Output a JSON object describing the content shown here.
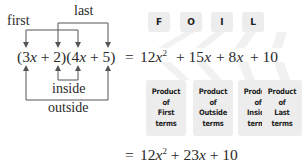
{
  "labels": {
    "first": "first",
    "last": "last",
    "inside": "inside",
    "outside": "outside"
  },
  "equation": {
    "lhs": [
      "(3",
      "x",
      " + 2)(4",
      "x",
      " + 5)"
    ],
    "line1": {
      "equals": "=",
      "terms": [
        "12x²",
        "+ 15x",
        "+ 8x",
        "+ 10"
      ]
    },
    "line2": {
      "equals": "=",
      "result": "12x² + 23x + 10"
    }
  },
  "foil": {
    "letters": [
      "F",
      "O",
      "I",
      "L"
    ],
    "boxes": [
      {
        "lines": [
          "Product",
          "of",
          "First",
          "terms"
        ]
      },
      {
        "lines": [
          "Product",
          "of",
          "Outside",
          "terms"
        ]
      },
      {
        "lines": [
          "Product",
          "of",
          "Inside",
          "terms"
        ]
      },
      {
        "lines": [
          "Product",
          "of",
          "Last",
          "terms"
        ]
      }
    ]
  },
  "colors": {
    "box_bg": "#ededed",
    "text": "#2a2a2a",
    "line": "#555555"
  }
}
